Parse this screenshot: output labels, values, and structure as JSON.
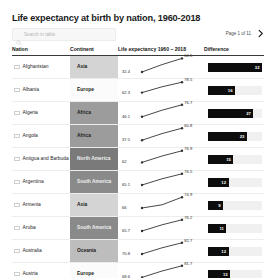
{
  "header": {
    "title": "Life expectancy at birth by nation, 1960-2018",
    "search_placeholder": "Search in table",
    "search_value": "",
    "search_icon": "search-icon",
    "pager_label": "Page 1 of 11",
    "pager_next_icon": "chevron-right-icon"
  },
  "columns": [
    {
      "key": "nation",
      "label": "Nation"
    },
    {
      "key": "continent",
      "label": "Continent"
    },
    {
      "key": "spark",
      "label": "Life expectancy 1960 – 2018"
    },
    {
      "key": "difference",
      "label": "Difference"
    }
  ],
  "colors": {
    "bar": "#0d0d0d",
    "bar_track": "#f0f0f0",
    "line": "#333333",
    "page_bg": "#f0f0f0",
    "card_bg": "#ffffff",
    "continent_asia": "#d4d4d4",
    "continent_europe": "#fbfbfb",
    "continent_africa": "#9c9c9c",
    "continent_north_america": "#7a7a7a",
    "continent_south_america": "#8a8a8a",
    "continent_oceania": "#bdbdbd"
  },
  "chart_data": {
    "type": "line",
    "title": "Life expectancy at birth by nation, 1960-2018",
    "xlabel": "Year",
    "ylabel": "Life expectancy (years)",
    "x": [
      1960,
      2018
    ],
    "series": [
      {
        "name": "Afghanistan",
        "continent": "Asia",
        "values": [
          32.4,
          64.5
        ],
        "difference": 32
      },
      {
        "name": "Albania",
        "continent": "Europe",
        "values": [
          62.3,
          78.5
        ],
        "difference": 16
      },
      {
        "name": "Algeria",
        "continent": "Africa",
        "values": [
          46.1,
          76.7
        ],
        "difference": 27
      },
      {
        "name": "Angola",
        "continent": "Africa",
        "values": [
          37.5,
          60.8
        ],
        "difference": 23
      },
      {
        "name": "Antigua and Barbuda",
        "continent": "North America",
        "values": [
          62.0,
          76.9
        ],
        "difference": 15
      },
      {
        "name": "Argentina",
        "continent": "South America",
        "values": [
          65.1,
          76.5
        ],
        "difference": 12
      },
      {
        "name": "Armenia",
        "continent": "Asia",
        "values": [
          66.0,
          74.9
        ],
        "difference": 9
      },
      {
        "name": "Aruba",
        "continent": "South America",
        "values": [
          65.7,
          76.2
        ],
        "difference": 11
      },
      {
        "name": "Australia",
        "continent": "Oceania",
        "values": [
          70.8,
          82.7
        ],
        "difference": 12
      },
      {
        "name": "Austria",
        "continent": "Europe",
        "values": [
          68.6,
          81.7
        ],
        "difference": 13
      },
      {
        "name": "",
        "continent": "",
        "values": [
          null,
          77.9
        ],
        "difference": null
      }
    ]
  },
  "rows": [
    {
      "nation": "Afghanistan",
      "flag": "flag-afghanistan-icon",
      "continent": "Asia",
      "cont_color": "#d4d4d4",
      "cont_text": "#1c1c1c",
      "start": "32.4",
      "end": "64.5",
      "y1": 0.2,
      "y2": 0.88,
      "difference": "32",
      "bar_pct": 100
    },
    {
      "nation": "Albania",
      "flag": "flag-albania-icon",
      "continent": "Europe",
      "cont_color": "#fbfbfb",
      "cont_text": "#1c1c1c",
      "start": "62.3",
      "end": "78.5",
      "y1": 0.32,
      "y2": 0.84,
      "difference": "16",
      "bar_pct": 50
    },
    {
      "nation": "Algeria",
      "flag": "flag-algeria-icon",
      "continent": "Africa",
      "cont_color": "#9c9c9c",
      "cont_text": "#1c1c1c",
      "start": "46.1",
      "end": "76.7",
      "y1": 0.26,
      "y2": 0.86,
      "difference": "27",
      "bar_pct": 84
    },
    {
      "nation": "Angola",
      "flag": "flag-angola-icon",
      "continent": "Africa",
      "cont_color": "#9c9c9c",
      "cont_text": "#1c1c1c",
      "start": "37.5",
      "end": "60.8",
      "y1": 0.24,
      "y2": 0.84,
      "difference": "23",
      "bar_pct": 72
    },
    {
      "nation": "Antigua and Barbuda",
      "flag": "flag-antigua-and-barbuda-icon",
      "continent": "North America",
      "cont_color": "#7a7a7a",
      "cont_text": "#efefef",
      "start": "62",
      "end": "76.9",
      "y1": 0.28,
      "y2": 0.86,
      "difference": "15",
      "bar_pct": 47
    },
    {
      "nation": "Argentina",
      "flag": "flag-argentina-icon",
      "continent": "South America",
      "cont_color": "#8a8a8a",
      "cont_text": "#efefef",
      "start": "65.1",
      "end": "76.5",
      "y1": 0.3,
      "y2": 0.86,
      "difference": "12",
      "bar_pct": 38
    },
    {
      "nation": "Armenia",
      "flag": "flag-armenia-icon",
      "continent": "Asia",
      "cont_color": "#d4d4d4",
      "cont_text": "#1c1c1c",
      "start": "66",
      "end": "74.9",
      "y1": 0.3,
      "y2": 0.84,
      "difference": "9",
      "bar_pct": 28
    },
    {
      "nation": "Aruba",
      "flag": "flag-aruba-icon",
      "continent": "South America",
      "cont_color": "#8a8a8a",
      "cont_text": "#efefef",
      "start": "65.7",
      "end": "76.2",
      "y1": 0.3,
      "y2": 0.86,
      "difference": "11",
      "bar_pct": 34
    },
    {
      "nation": "Australia",
      "flag": "flag-australia-icon",
      "continent": "Oceania",
      "cont_color": "#bdbdbd",
      "cont_text": "#1c1c1c",
      "start": "70.8",
      "end": "82.7",
      "y1": 0.3,
      "y2": 0.86,
      "difference": "12",
      "bar_pct": 38
    },
    {
      "nation": "Austria",
      "flag": "flag-austria-icon",
      "continent": "Europe",
      "cont_color": "#fbfbfb",
      "cont_text": "#1c1c1c",
      "start": "68.6",
      "end": "81.7",
      "y1": 0.28,
      "y2": 0.86,
      "difference": "13",
      "bar_pct": 41
    },
    {
      "nation": "",
      "flag": "flag-azerbaijan-icon",
      "continent": "",
      "cont_color": "#c9c9c9",
      "cont_text": "#1c1c1c",
      "start": "",
      "end": "77.9",
      "y1": 0.3,
      "y2": 0.84,
      "difference": "",
      "bar_pct": 30
    }
  ]
}
